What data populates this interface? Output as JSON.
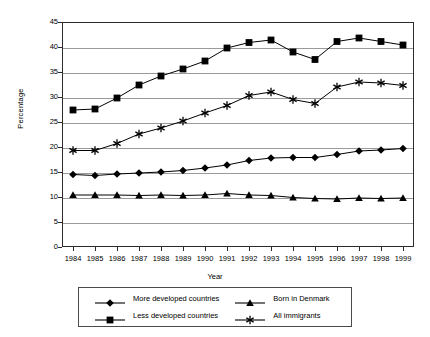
{
  "chart_data": {
    "type": "line",
    "title": "",
    "xlabel": "Year",
    "ylabel": "Percentage",
    "xlim": [
      1984,
      1999
    ],
    "ylim": [
      0,
      45
    ],
    "ytick_step": 5,
    "grid": true,
    "legend_position": "bottom",
    "x": [
      1984,
      1985,
      1986,
      1987,
      1988,
      1989,
      1990,
      1991,
      1992,
      1993,
      1994,
      1995,
      1996,
      1997,
      1998,
      1999
    ],
    "xticklabels": [
      "1984",
      "1985",
      "1986",
      "1987",
      "1988",
      "1989",
      "1990",
      "1991",
      "1992",
      "1993",
      "1994",
      "1995",
      "1996",
      "1997",
      "1998",
      "1999"
    ],
    "yticklabels": [
      "0",
      "5",
      "10",
      "15",
      "20",
      "25",
      "30",
      "35",
      "40",
      "45"
    ],
    "yticks": [
      0,
      5,
      10,
      15,
      20,
      25,
      30,
      35,
      40,
      45
    ],
    "series": [
      {
        "name": "More developed countries",
        "marker": "diamond",
        "color": "#000000",
        "values": [
          14.5,
          14.3,
          14.6,
          14.8,
          15.0,
          15.3,
          15.8,
          16.4,
          17.3,
          17.8,
          17.9,
          17.9,
          18.5,
          19.2,
          19.4,
          19.7
        ]
      },
      {
        "name": "Less developed countries",
        "marker": "square",
        "color": "#000000",
        "values": [
          27.4,
          27.6,
          29.8,
          32.4,
          34.2,
          35.6,
          37.2,
          39.8,
          40.9,
          41.4,
          39.0,
          37.5,
          41.1,
          41.8,
          41.1,
          40.4
        ]
      },
      {
        "name": "Born in Denmark",
        "marker": "triangle",
        "color": "#000000",
        "values": [
          10.4,
          10.4,
          10.4,
          10.3,
          10.4,
          10.3,
          10.4,
          10.7,
          10.4,
          10.3,
          9.9,
          9.7,
          9.6,
          9.8,
          9.7,
          9.8
        ]
      },
      {
        "name": "All immigrants",
        "marker": "asterisk",
        "color": "#000000",
        "values": [
          19.3,
          19.3,
          20.7,
          22.6,
          23.8,
          25.2,
          26.8,
          28.3,
          30.3,
          31.0,
          29.5,
          28.7,
          32.0,
          33.0,
          32.8,
          32.3
        ]
      }
    ]
  },
  "axis": {
    "x_title": "Year",
    "y_title": "Percentage"
  },
  "legend": {
    "entries": [
      {
        "label": "More developed countries",
        "marker": "diamond"
      },
      {
        "label": "Born in Denmark",
        "marker": "triangle"
      },
      {
        "label": "Less developed countries",
        "marker": "square"
      },
      {
        "label": "All immigrants",
        "marker": "asterisk"
      }
    ]
  }
}
